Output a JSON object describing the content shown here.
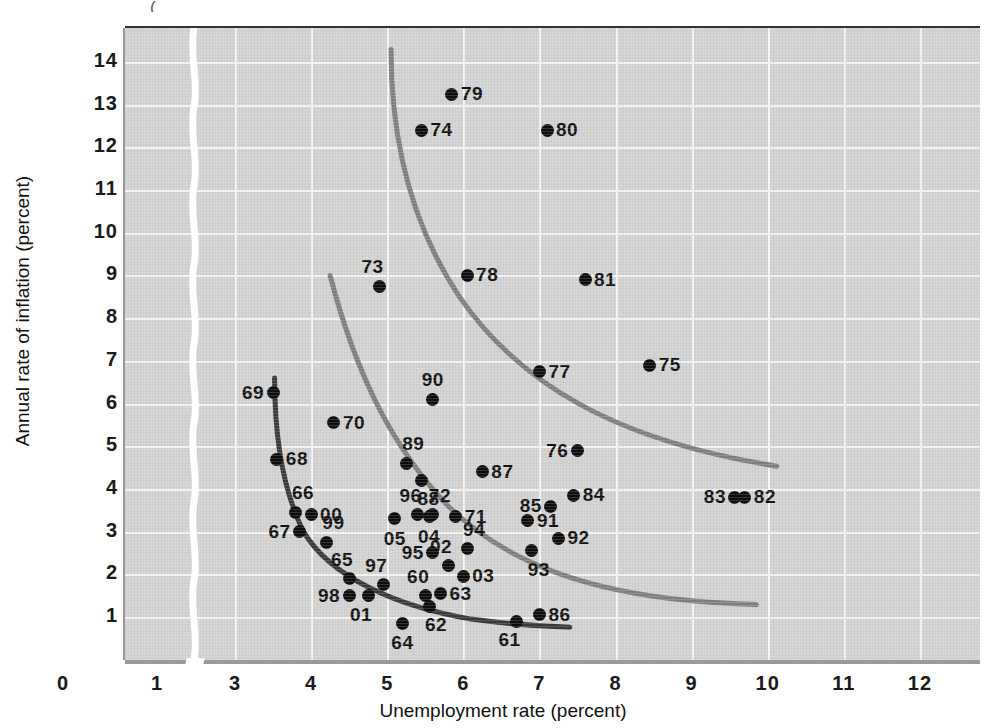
{
  "figure": {
    "cropped_caption_fragment": "(",
    "plot_background": "#d2d2d2",
    "point_color": "#0d0d0d",
    "curve_short_run_color": "#3a3a3a",
    "curve_long_run_color": "#808080"
  },
  "chart_data": {
    "type": "scatter",
    "title": "",
    "xlabel": "Unemployment rate (percent)",
    "ylabel": "Annual rate of inflation (percent)",
    "xlim": [
      0,
      12.6
    ],
    "ylim": [
      0.35,
      14.6
    ],
    "x_ticks": [
      "0",
      "1",
      "3",
      "4",
      "5",
      "6",
      "7",
      "8",
      "9",
      "10",
      "11",
      "12"
    ],
    "x_tick_values": [
      0,
      1,
      3,
      4,
      5,
      6,
      7,
      8,
      9,
      10,
      11,
      12
    ],
    "y_ticks": [
      "1",
      "2",
      "3",
      "4",
      "5",
      "6",
      "7",
      "8",
      "9",
      "10",
      "11",
      "12",
      "13",
      "14"
    ],
    "y_tick_values": [
      1,
      2,
      3,
      4,
      5,
      6,
      7,
      8,
      9,
      10,
      11,
      12,
      13,
      14
    ],
    "axis_break_after_x": 1,
    "grid": true,
    "grid_color": "#f4f4f4",
    "legend": "none",
    "points": [
      {
        "label": "60",
        "x": 5.5,
        "y": 1.5,
        "pos": "lab-tl"
      },
      {
        "label": "61",
        "x": 6.7,
        "y": 0.9,
        "pos": "lab-bl"
      },
      {
        "label": "62",
        "x": 5.55,
        "y": 1.25,
        "pos": "lab-br"
      },
      {
        "label": "63",
        "x": 5.7,
        "y": 1.55,
        "pos": "lab-r"
      },
      {
        "label": "64",
        "x": 5.2,
        "y": 0.85,
        "pos": "lab-b"
      },
      {
        "label": "65",
        "x": 4.5,
        "y": 1.9,
        "pos": "lab-tl"
      },
      {
        "label": "66",
        "x": 3.8,
        "y": 3.45,
        "pos": "lab-tr"
      },
      {
        "label": "67",
        "x": 3.85,
        "y": 3.0,
        "pos": "lab-l"
      },
      {
        "label": "68",
        "x": 3.55,
        "y": 4.7,
        "pos": "lab-r"
      },
      {
        "label": "69",
        "x": 3.5,
        "y": 6.25,
        "pos": "lab-l"
      },
      {
        "label": "70",
        "x": 4.3,
        "y": 5.55,
        "pos": "lab-r"
      },
      {
        "label": "71",
        "x": 5.9,
        "y": 3.35,
        "pos": "lab-r"
      },
      {
        "label": "72",
        "x": 5.6,
        "y": 3.4,
        "pos": "lab-tr"
      },
      {
        "label": "73",
        "x": 4.9,
        "y": 8.75,
        "pos": "lab-tl"
      },
      {
        "label": "74",
        "x": 5.45,
        "y": 12.4,
        "pos": "lab-r"
      },
      {
        "label": "75",
        "x": 8.45,
        "y": 6.9,
        "pos": "lab-r"
      },
      {
        "label": "76",
        "x": 7.5,
        "y": 4.9,
        "pos": "lab-l"
      },
      {
        "label": "77",
        "x": 7.0,
        "y": 6.75,
        "pos": "lab-r"
      },
      {
        "label": "78",
        "x": 6.05,
        "y": 9.0,
        "pos": "lab-r"
      },
      {
        "label": "79",
        "x": 5.85,
        "y": 13.25,
        "pos": "lab-r"
      },
      {
        "label": "80",
        "x": 7.1,
        "y": 12.4,
        "pos": "lab-r"
      },
      {
        "label": "81",
        "x": 7.6,
        "y": 8.9,
        "pos": "lab-r"
      },
      {
        "label": "82",
        "x": 9.7,
        "y": 3.8,
        "pos": "lab-r"
      },
      {
        "label": "83",
        "x": 9.57,
        "y": 3.8,
        "pos": "lab-l"
      },
      {
        "label": "84",
        "x": 7.45,
        "y": 3.85,
        "pos": "lab-r"
      },
      {
        "label": "85",
        "x": 7.15,
        "y": 3.6,
        "pos": "lab-l"
      },
      {
        "label": "86",
        "x": 7.0,
        "y": 1.05,
        "pos": "lab-r"
      },
      {
        "label": "87",
        "x": 6.25,
        "y": 4.4,
        "pos": "lab-r"
      },
      {
        "label": "88",
        "x": 5.45,
        "y": 4.2,
        "pos": "lab-br"
      },
      {
        "label": "89",
        "x": 5.25,
        "y": 4.6,
        "pos": "lab-tr"
      },
      {
        "label": "90",
        "x": 5.6,
        "y": 6.1,
        "pos": "lab-t"
      },
      {
        "label": "91",
        "x": 6.85,
        "y": 3.25,
        "pos": "lab-r"
      },
      {
        "label": "92",
        "x": 7.25,
        "y": 2.85,
        "pos": "lab-r"
      },
      {
        "label": "93",
        "x": 6.9,
        "y": 2.55,
        "pos": "lab-br"
      },
      {
        "label": "94",
        "x": 6.05,
        "y": 2.6,
        "pos": "lab-tr"
      },
      {
        "label": "95",
        "x": 5.6,
        "y": 2.5,
        "pos": "lab-l"
      },
      {
        "label": "96",
        "x": 5.4,
        "y": 3.4,
        "pos": "lab-tl"
      },
      {
        "label": "97",
        "x": 4.95,
        "y": 1.75,
        "pos": "lab-tl"
      },
      {
        "label": "98",
        "x": 4.5,
        "y": 1.5,
        "pos": "lab-l"
      },
      {
        "label": "99",
        "x": 4.2,
        "y": 2.75,
        "pos": "lab-tr"
      },
      {
        "label": "00",
        "x": 4.0,
        "y": 3.4,
        "pos": "lab-r"
      },
      {
        "label": "01",
        "x": 4.75,
        "y": 1.5,
        "pos": "lab-bl"
      },
      {
        "label": "02",
        "x": 5.8,
        "y": 2.2,
        "pos": "lab-tl"
      },
      {
        "label": "03",
        "x": 6.0,
        "y": 1.95,
        "pos": "lab-r"
      },
      {
        "label": "04",
        "x": 5.55,
        "y": 3.35,
        "pos": "lab-b"
      },
      {
        "label": "05",
        "x": 5.1,
        "y": 3.3,
        "pos": "lab-b"
      }
    ],
    "curves": [
      {
        "name": "short-run-phillips-curve-1960s",
        "color": "#3a3a3a",
        "path": "M 3.52 6.60 C 3.52 5.20, 3.62 4.00, 3.90 3.00 C 4.25 1.95, 5.10 1.25, 6.10 0.95 C 6.60 0.83, 7.05 0.78, 7.40 0.76"
      },
      {
        "name": "short-run-phillips-curve-1970s",
        "color": "#808080",
        "path": "M 4.25 9.00 C 4.60 6.60, 5.10 4.90, 5.80 3.60 C 6.60 2.20, 7.70 1.60, 9.00 1.38 C 9.35 1.33, 9.65 1.30, 9.85 1.29"
      },
      {
        "name": "short-run-phillips-curve-1980s",
        "color": "#808080",
        "path": "M 5.05 14.30 C 5.05 12.00, 5.35 10.10, 5.95 8.50 C 6.80 6.30, 8.10 5.25, 9.60 4.70 C 9.90 4.60, 10.05 4.55, 10.12 4.53"
      }
    ]
  }
}
